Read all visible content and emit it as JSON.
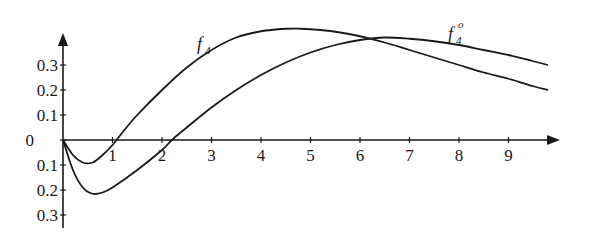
{
  "chart_data": {
    "type": "line",
    "title": "",
    "xlabel": "",
    "ylabel": "",
    "xlim": [
      0,
      9.8
    ],
    "ylim": [
      -0.3,
      0.45
    ],
    "grid": false,
    "legend": "inline labels on curves",
    "x_ticks": [
      "1",
      "2",
      "3",
      "4",
      "5",
      "6",
      "7",
      "8",
      "9"
    ],
    "y_ticks": [
      "0.3",
      "0.2",
      "0.1",
      "0",
      "0.1",
      "0.2",
      "0.3"
    ],
    "y_tick_values": [
      0.3,
      0.2,
      0.1,
      0,
      -0.1,
      -0.2,
      -0.3
    ],
    "series": [
      {
        "name": "f4",
        "label": "f",
        "subscript": "4",
        "superscript": "",
        "x": [
          0,
          0.2,
          0.4,
          0.6,
          0.8,
          1.0,
          1.2,
          1.5,
          2.0,
          2.5,
          3.0,
          3.5,
          4.0,
          4.5,
          4.8,
          5.2,
          5.6,
          6.0,
          6.5,
          7.0,
          7.5,
          8.0,
          8.5,
          9.0,
          9.5,
          9.8
        ],
        "values": [
          0,
          -0.06,
          -0.09,
          -0.09,
          -0.06,
          -0.02,
          0.03,
          0.1,
          0.2,
          0.29,
          0.36,
          0.41,
          0.435,
          0.445,
          0.445,
          0.44,
          0.43,
          0.415,
          0.39,
          0.36,
          0.33,
          0.3,
          0.27,
          0.245,
          0.215,
          0.2
        ]
      },
      {
        "name": "f4o",
        "label": "f",
        "subscript": "4",
        "superscript": "o",
        "x": [
          0,
          0.2,
          0.4,
          0.6,
          0.8,
          1.0,
          1.5,
          2.0,
          2.2,
          2.5,
          3.0,
          3.5,
          4.0,
          4.5,
          5.0,
          5.5,
          6.0,
          6.5,
          7.0,
          7.5,
          8.0,
          8.5,
          9.0,
          9.5,
          9.8
        ],
        "values": [
          0,
          -0.12,
          -0.19,
          -0.215,
          -0.21,
          -0.19,
          -0.12,
          -0.04,
          0,
          0.05,
          0.13,
          0.2,
          0.26,
          0.31,
          0.35,
          0.38,
          0.4,
          0.41,
          0.405,
          0.395,
          0.38,
          0.36,
          0.34,
          0.315,
          0.3
        ]
      }
    ],
    "annotations": [
      {
        "text": "f4",
        "near": "f4 curve at x≈3"
      },
      {
        "text": "f4^o",
        "near": "f4o curve at x≈7.8"
      }
    ]
  }
}
